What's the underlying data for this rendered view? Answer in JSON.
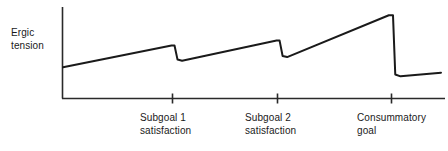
{
  "chart_data": {
    "type": "line",
    "title": "",
    "xlabel": "",
    "ylabel": "Ergic tension",
    "ylabel_lines": [
      "Ergic",
      "tension"
    ],
    "grid": false,
    "legend": null,
    "axis_ticks_y": [],
    "xtick_labels": [
      {
        "lines": [
          "Subgoal 1",
          "satisfaction"
        ],
        "text": "Subgoal 1 satisfaction",
        "x": 0.295
      },
      {
        "lines": [
          "Subgoal 2",
          "satisfaction"
        ],
        "text": "Subgoal 2 satisfaction",
        "x": 0.573
      },
      {
        "lines": [
          "Consummatory",
          "goal"
        ],
        "text": "Consummatory goal",
        "x": 0.873
      }
    ],
    "xlim": [
      0,
      1
    ],
    "ylim": [
      0,
      1
    ],
    "series": [
      {
        "name": "Ergic tension",
        "color": "#1a1a1a",
        "points": [
          {
            "x": 0.0,
            "y": 0.345
          },
          {
            "x": 0.287,
            "y": 0.585
          },
          {
            "x": 0.295,
            "y": 0.585
          },
          {
            "x": 0.303,
            "y": 0.43
          },
          {
            "x": 0.315,
            "y": 0.418
          },
          {
            "x": 0.565,
            "y": 0.64
          },
          {
            "x": 0.573,
            "y": 0.64
          },
          {
            "x": 0.581,
            "y": 0.47
          },
          {
            "x": 0.593,
            "y": 0.458
          },
          {
            "x": 0.862,
            "y": 0.92
          },
          {
            "x": 0.873,
            "y": 0.92
          },
          {
            "x": 0.879,
            "y": 0.265
          },
          {
            "x": 0.893,
            "y": 0.245
          },
          {
            "x": 1.0,
            "y": 0.285
          }
        ]
      }
    ]
  },
  "axes": {
    "y_axis_name": "y-axis-line",
    "x_axis_name": "x-axis-line",
    "tick_count": 3
  }
}
